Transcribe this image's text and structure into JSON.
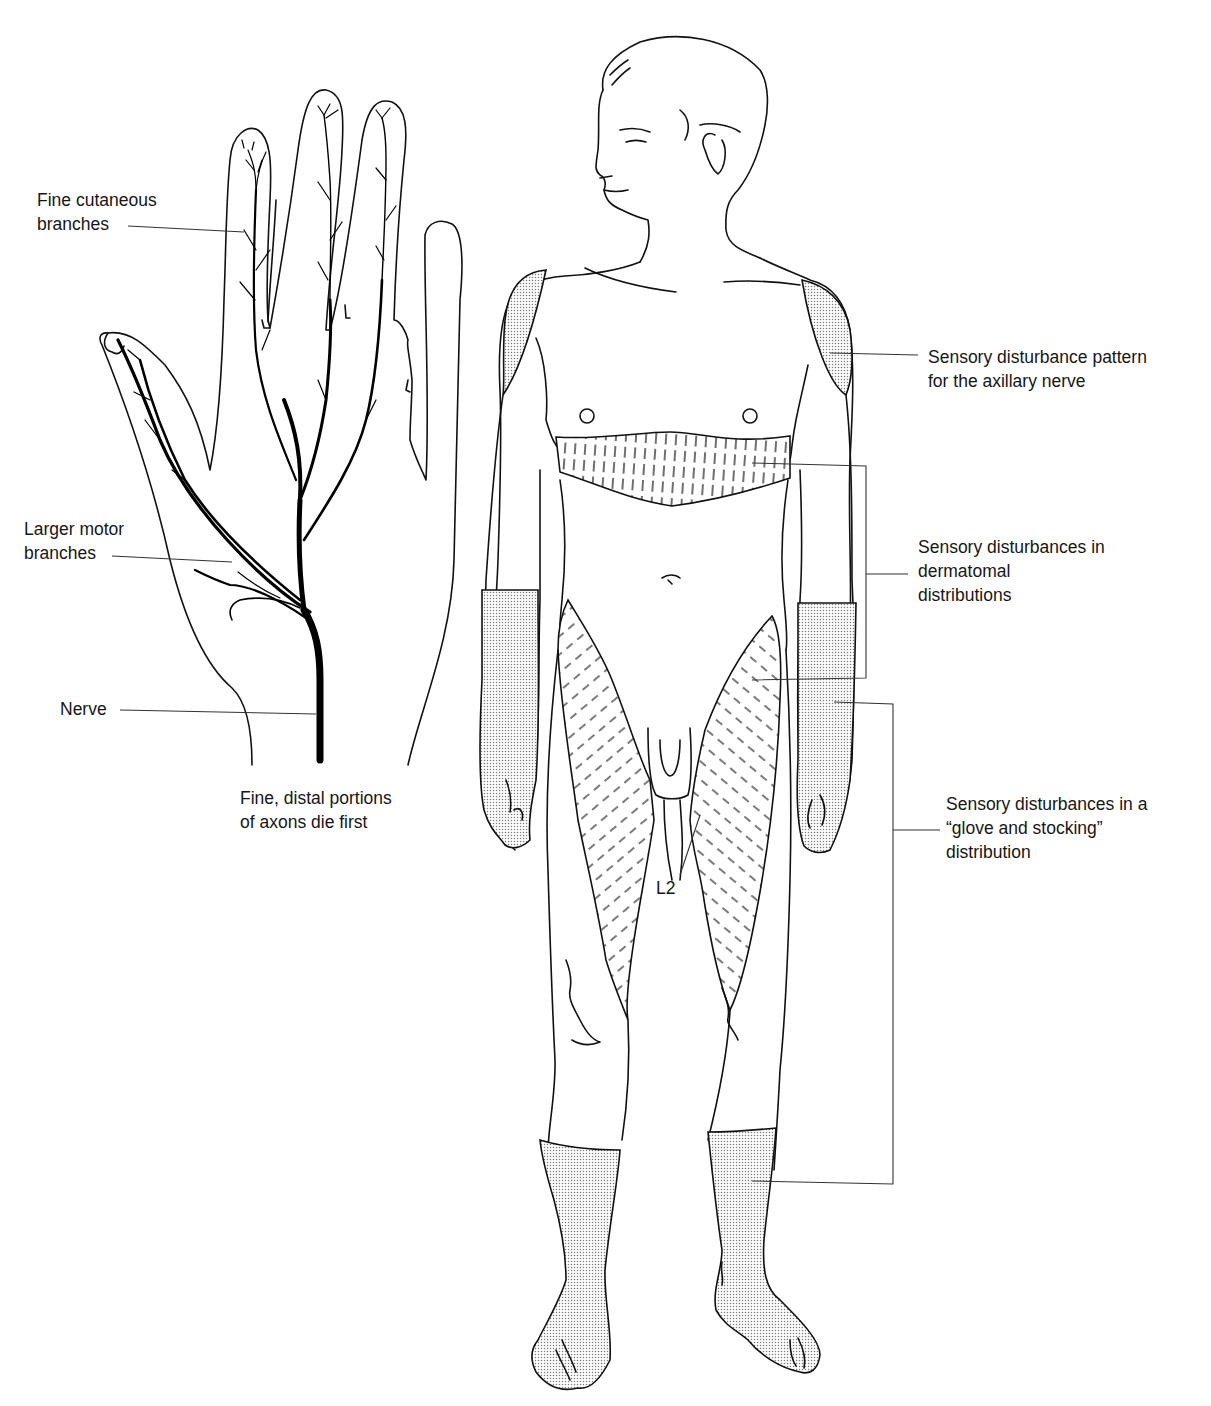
{
  "figure": {
    "hand_panel": {
      "labels": {
        "fine_cutaneous": {
          "line1": "Fine cutaneous",
          "line2": "branches"
        },
        "larger_motor": {
          "line1": "Larger motor",
          "line2": "branches"
        },
        "nerve": {
          "line1": "Nerve"
        },
        "caption": {
          "line1": "Fine, distal portions",
          "line2": "of axons die first"
        }
      }
    },
    "body_panel": {
      "labels": {
        "axillary": {
          "line1": "Sensory disturbance pattern",
          "line2": "for the axillary nerve"
        },
        "dermatomal": {
          "line1": "Sensory disturbances in",
          "line2": "dermatomal",
          "line3": "distributions"
        },
        "glove_stocking": {
          "line1": "Sensory disturbances in a",
          "line2": "“glove and stocking”",
          "line3": "distribution"
        },
        "dermatome_marker": "L2"
      },
      "shading": {
        "stipple_color": "#9a9a9a",
        "hatch_color": "#222222"
      }
    }
  }
}
